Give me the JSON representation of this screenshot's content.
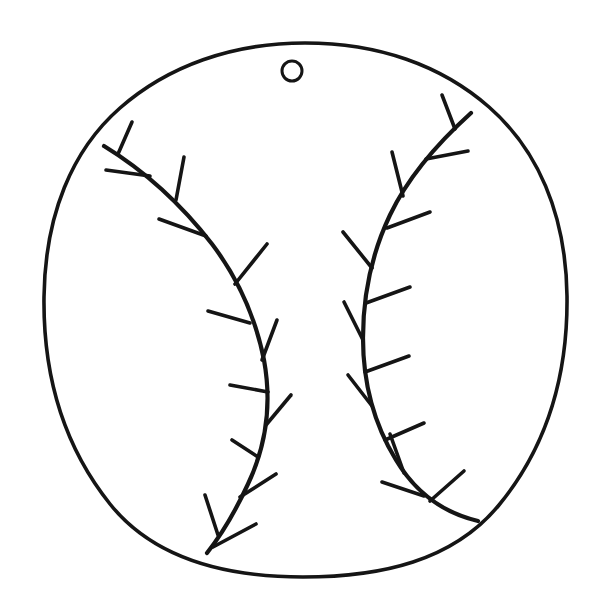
{
  "document": {
    "title": "Baseball Ornament Coloring Page",
    "kind": "line-art-drawing",
    "subject": "baseball",
    "style": "hand-drawn black outline on white",
    "canvas": {
      "width": 605,
      "height": 613,
      "background": "#ffffff"
    }
  },
  "palette": {
    "ink": "#151515",
    "paper": "#ffffff"
  },
  "shapes": {
    "ball": {
      "name": "ball-outline",
      "description": "large hand-drawn circle forming the baseball body",
      "center_x": 305,
      "center_y": 310,
      "radius_x": 262,
      "radius_y": 267,
      "stroke_width": 3.6,
      "path": "M 305 43 C 378 43 441 65 489 107 C 537 149 566 213 567 296 C 568 379 545 449 499 505 C 453 561 381 577 303 577 C 225 577 154 559 110 504 C 66 449 43 379 44 297 C 45 215 72 150 120 108 C 168 66 232 43 305 43 Z"
    },
    "hole": {
      "name": "hanging-hole",
      "description": "small open circle near the top used as a hanging hole",
      "center_x": 292,
      "center_y": 71,
      "radius": 10,
      "stroke_width": 3.0
    },
    "left_seam": {
      "name": "left-seam",
      "description": "curved stitching seam on the left half, running from upper-left rim down to bottom rim",
      "spine_path": "M 104 146 C 140 168 178 200 212 244 C 240 281 256 320 264 360 C 272 404 266 446 248 484 C 236 510 222 534 207 553",
      "stitch_count": 12,
      "stitches": [
        {
          "id": 1,
          "x1": 118,
          "y1": 154,
          "x2": 132,
          "y2": 122,
          "side": "upper"
        },
        {
          "id": 2,
          "x1": 150,
          "y1": 176,
          "x2": 106,
          "y2": 170,
          "side": "lower"
        },
        {
          "id": 3,
          "x1": 176,
          "y1": 200,
          "x2": 184,
          "y2": 157,
          "side": "upper"
        },
        {
          "id": 4,
          "x1": 206,
          "y1": 236,
          "x2": 159,
          "y2": 219,
          "side": "lower"
        },
        {
          "id": 5,
          "x1": 235,
          "y1": 284,
          "x2": 267,
          "y2": 244,
          "side": "upper"
        },
        {
          "id": 6,
          "x1": 250,
          "y1": 323,
          "x2": 208,
          "y2": 311,
          "side": "lower"
        },
        {
          "id": 7,
          "x1": 262,
          "y1": 360,
          "x2": 277,
          "y2": 320,
          "side": "upper"
        },
        {
          "id": 8,
          "x1": 268,
          "y1": 392,
          "x2": 230,
          "y2": 385,
          "side": "lower"
        },
        {
          "id": 9,
          "x1": 266,
          "y1": 425,
          "x2": 291,
          "y2": 395,
          "side": "upper"
        },
        {
          "id": 10,
          "x1": 258,
          "y1": 457,
          "x2": 232,
          "y2": 440,
          "side": "lower"
        },
        {
          "id": 11,
          "x1": 240,
          "y1": 497,
          "x2": 276,
          "y2": 474,
          "side": "upper"
        },
        {
          "id": 12,
          "x1": 218,
          "y1": 535,
          "x2": 205,
          "y2": 495,
          "side": "upper"
        }
      ],
      "extra_stitches": [
        {
          "id": 13,
          "x1": 213,
          "y1": 547,
          "x2": 256,
          "y2": 524,
          "side": "lower"
        }
      ]
    },
    "right_seam": {
      "name": "right-seam",
      "description": "curved stitching seam on the right half, mirroring the left, running from upper-right rim down to lower-right rim",
      "spine_path": "M 471 113 C 440 141 409 175 390 215 C 371 255 363 297 363 338 C 363 382 374 424 396 460 C 414 490 440 512 478 521",
      "stitch_count": 12,
      "stitches": [
        {
          "id": 1,
          "x1": 455,
          "y1": 129,
          "x2": 442,
          "y2": 95,
          "side": "upper"
        },
        {
          "id": 2,
          "x1": 426,
          "y1": 159,
          "x2": 468,
          "y2": 151,
          "side": "lower"
        },
        {
          "id": 3,
          "x1": 403,
          "y1": 196,
          "x2": 392,
          "y2": 152,
          "side": "upper"
        },
        {
          "id": 4,
          "x1": 387,
          "y1": 228,
          "x2": 430,
          "y2": 212,
          "side": "lower"
        },
        {
          "id": 5,
          "x1": 372,
          "y1": 268,
          "x2": 343,
          "y2": 232,
          "side": "upper"
        },
        {
          "id": 6,
          "x1": 366,
          "y1": 303,
          "x2": 410,
          "y2": 287,
          "side": "lower"
        },
        {
          "id": 7,
          "x1": 363,
          "y1": 340,
          "x2": 344,
          "y2": 302,
          "side": "upper"
        },
        {
          "id": 8,
          "x1": 365,
          "y1": 372,
          "x2": 409,
          "y2": 356,
          "side": "lower"
        },
        {
          "id": 9,
          "x1": 372,
          "y1": 406,
          "x2": 348,
          "y2": 375,
          "side": "upper"
        },
        {
          "id": 10,
          "x1": 385,
          "y1": 440,
          "x2": 424,
          "y2": 423,
          "side": "lower"
        },
        {
          "id": 11,
          "x1": 404,
          "y1": 473,
          "x2": 390,
          "y2": 434,
          "side": "upper"
        },
        {
          "id": 12,
          "x1": 430,
          "y1": 501,
          "x2": 464,
          "y2": 471,
          "side": "lower"
        }
      ],
      "extra_stitches": [
        {
          "id": 13,
          "x1": 424,
          "y1": 496,
          "x2": 382,
          "y2": 482,
          "side": "lower"
        }
      ]
    }
  }
}
